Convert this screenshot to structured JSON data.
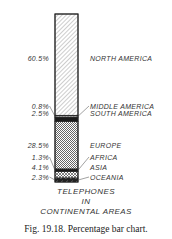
{
  "chart_data": {
    "type": "bar",
    "subtype": "100% stacked single bar",
    "title_lines": [
      "TELEPHONES",
      "IN",
      "CONTINENTAL AREAS"
    ],
    "categories": [
      "NORTH AMERICA",
      "MIDDLE AMERICA",
      "SOUTH AMERICA",
      "EUROPE",
      "AFRICA",
      "ASIA",
      "OCEANIA"
    ],
    "values": [
      60.5,
      0.8,
      2.5,
      28.5,
      1.3,
      4.1,
      2.3
    ],
    "value_labels": [
      "60.5%",
      "0.8%",
      "2.5%",
      "28.5%",
      "1.3%",
      "4.1%",
      "2.3%"
    ],
    "unit": "%",
    "ylim": [
      0,
      100
    ],
    "xlabel": "",
    "ylabel": "",
    "grid": false,
    "legend": "labels placed to right of bar; percentages to left"
  },
  "caption": "Fig. 19.18. Percentage bar chart."
}
